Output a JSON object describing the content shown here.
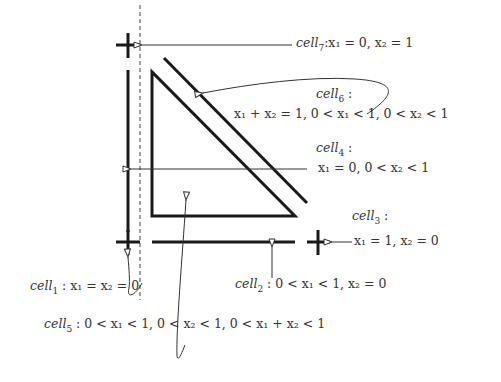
{
  "diagram": {
    "title": "",
    "stroke_color": "#1a1a1a",
    "text_color": "#333333",
    "cells": [
      {
        "id": "cell1",
        "label": "cell₁ : x₁ = x₂ = 0",
        "name": "cell",
        "sub": "1",
        "desc": " : x₁ = x₂ = 0"
      },
      {
        "id": "cell2",
        "label": "cell₂ : 0 < x₁ < 1, x₂ = 0",
        "name": "cell",
        "sub": "2",
        "desc": " : 0 < x₁ < 1, x₂ = 0"
      },
      {
        "id": "cell3",
        "label": "cell₃ : x₁ = 1, x₂ = 0",
        "name": "cell",
        "sub": "3",
        "head": " :",
        "desc": "x₁ = 1, x₂ = 0"
      },
      {
        "id": "cell4",
        "label": "cell₄ : x₁ = 0, 0 < x₂ < 1",
        "name": "cell",
        "sub": "4",
        "head": " :",
        "desc": "x₁ = 0, 0 < x₂ < 1"
      },
      {
        "id": "cell5",
        "label": "cell₅ : 0 < x₁ < 1, 0 < x₂ < 1, 0 < x₁ + x₂ < 1",
        "name": "cell",
        "sub": "5",
        "desc": " : 0 < x₁ < 1, 0 < x₂ < 1, 0 < x₁ + x₂ < 1"
      },
      {
        "id": "cell6",
        "label": "cell₆ : x₁ + x₂ = 1, 0 < x₁ < 1, 0 < x₂ < 1",
        "name": "cell",
        "sub": "6",
        "head": " :",
        "desc": "x₁ + x₂ = 1, 0 < x₁ < 1, 0 < x₂ < 1"
      },
      {
        "id": "cell7",
        "label": "cell₇ : x₁ = 0, x₂ = 1",
        "name": "cell",
        "sub": "7",
        "desc": ":x₁ = 0, x₂ = 1"
      }
    ]
  }
}
